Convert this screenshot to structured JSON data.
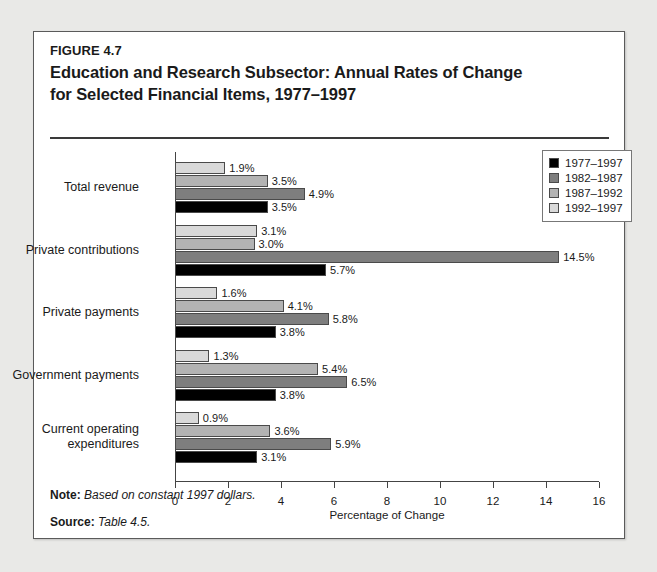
{
  "figure": {
    "number": "FIGURE 4.7",
    "title_line1": "Education and Research Subsector: Annual Rates of Change",
    "title_line2": "for Selected Financial Items, 1977–1997"
  },
  "footnotes": [
    {
      "label": "Note:",
      "text": "Based on constant 1997 dollars."
    },
    {
      "label": "Source:",
      "text": "Table 4.5."
    }
  ],
  "chart_data": {
    "type": "bar",
    "orientation": "horizontal",
    "title": "Education and Research Subsector: Annual Rates of Change for Selected Financial Items, 1977–1997",
    "xlabel": "Percentage of Change",
    "ylabel": "",
    "xlim": [
      0,
      16
    ],
    "xticks": [
      0,
      2,
      4,
      6,
      8,
      10,
      12,
      14,
      16
    ],
    "xticklabels": [
      "0",
      "2",
      "4",
      "6",
      "8",
      "10",
      "12",
      "14",
      "16"
    ],
    "grid": false,
    "legend_position": "top-right",
    "value_suffix": "%",
    "categories": [
      "Total revenue",
      "Private contributions",
      "Private payments",
      "Government payments",
      "Current operating expenditures"
    ],
    "series": [
      {
        "name": "1977–1997",
        "color": "#000000",
        "values": [
          3.5,
          5.7,
          3.8,
          3.8,
          3.1
        ],
        "labels": [
          "3.5%",
          "5.7%",
          "3.8%",
          "3.8%",
          "3.1%"
        ]
      },
      {
        "name": "1982–1987",
        "color": "#7e7e7e",
        "values": [
          4.9,
          14.5,
          5.8,
          6.5,
          5.9
        ],
        "labels": [
          "4.9%",
          "14.5%",
          "5.8%",
          "6.5%",
          "5.9%"
        ]
      },
      {
        "name": "1987–1992",
        "color": "#b3b3b3",
        "values": [
          3.5,
          3.0,
          4.1,
          5.4,
          3.6
        ],
        "labels": [
          "3.5%",
          "3.0%",
          "4.1%",
          "5.4%",
          "3.6%"
        ]
      },
      {
        "name": "1992–1997",
        "color": "#d9d9d9",
        "values": [
          1.9,
          3.1,
          1.6,
          1.3,
          0.9
        ],
        "labels": [
          "1.9%",
          "3.1%",
          "1.6%",
          "1.3%",
          "0.9%"
        ]
      }
    ],
    "bar_draw_order_top_to_bottom": [
      "1992–1997",
      "1987–1992",
      "1982–1987",
      "1977–1997"
    ]
  }
}
